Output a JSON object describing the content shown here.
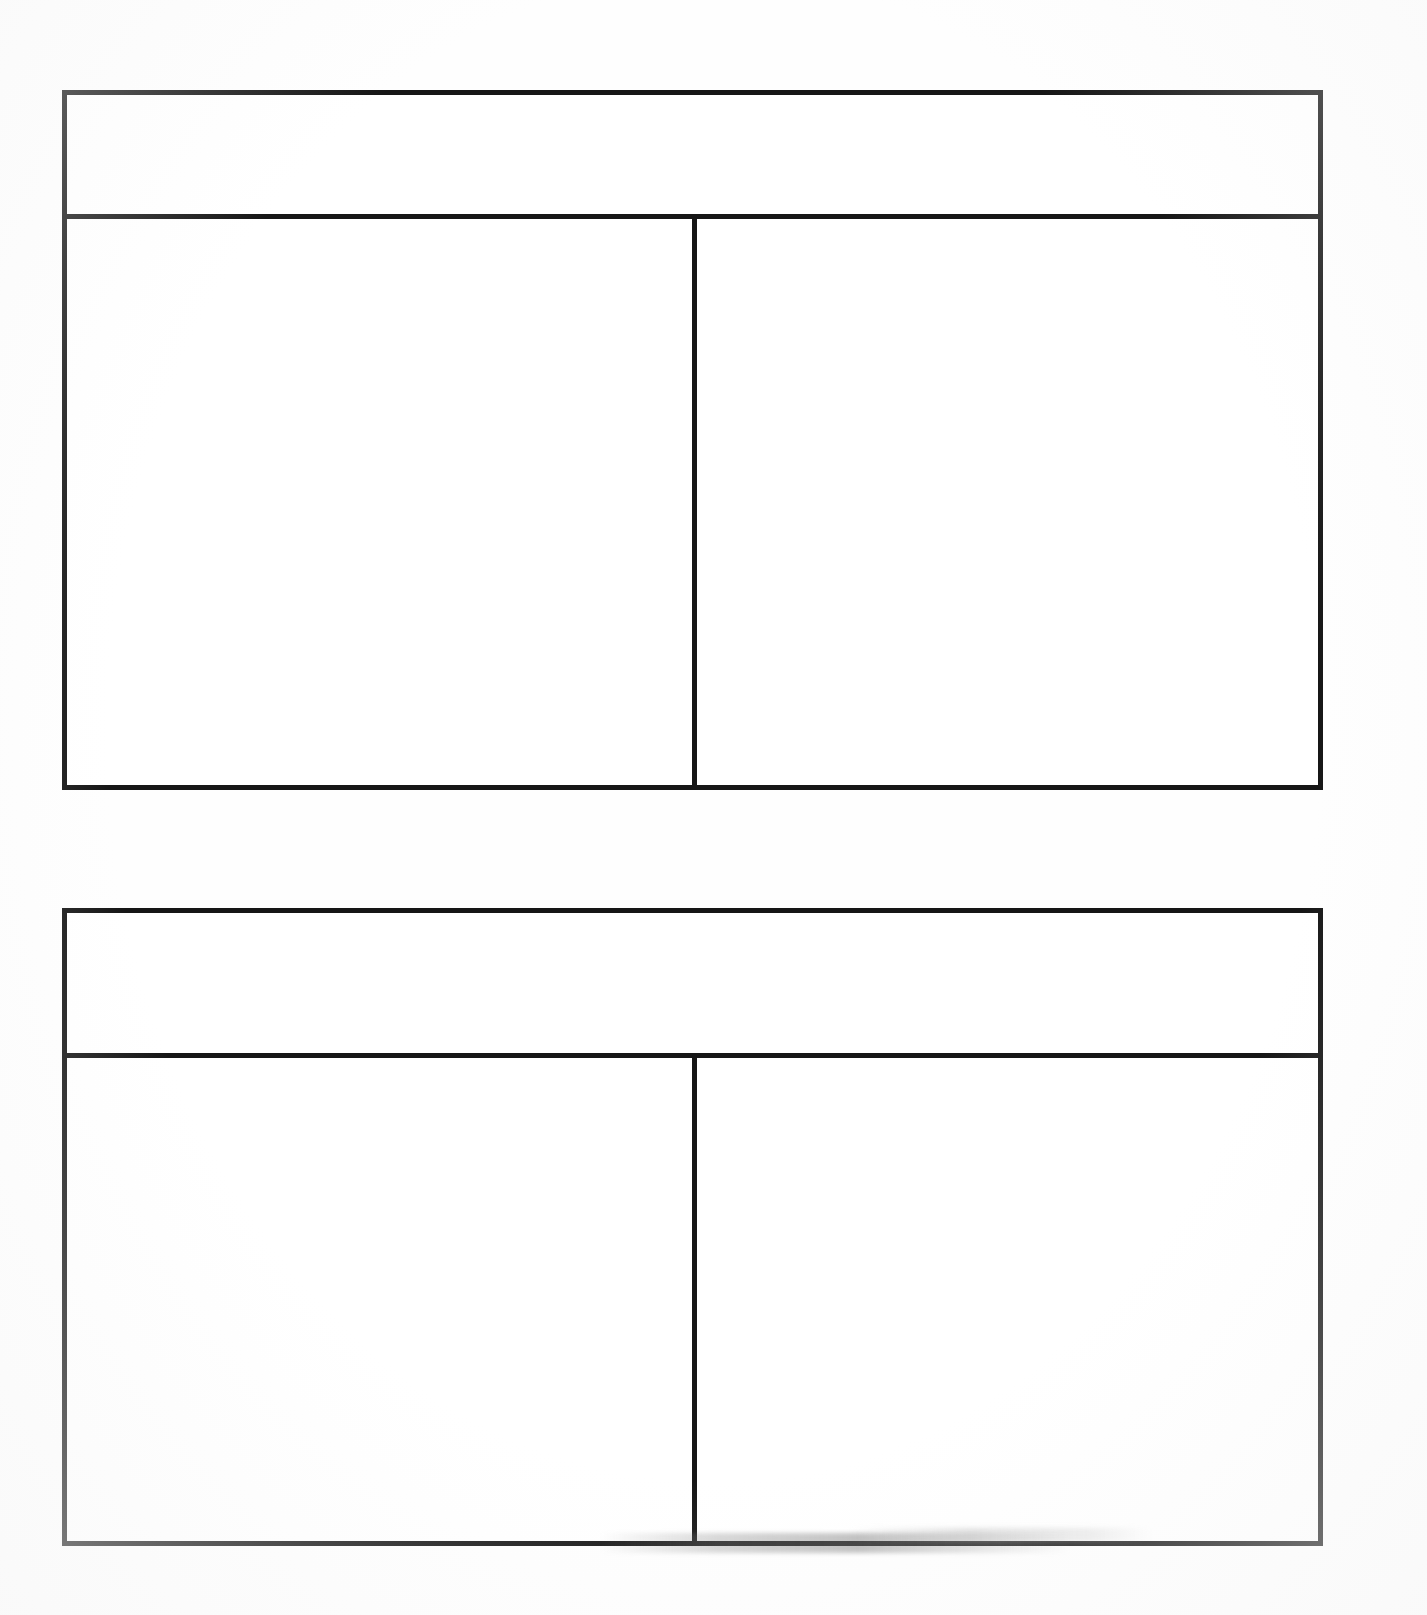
{
  "document": {
    "background_color": "#ffffff",
    "line_color": "#161616",
    "page_width": 1427,
    "page_height": 1615,
    "description": "Scanned page containing two blank two-column tables"
  },
  "tables": [
    {
      "id": "table-1",
      "header": {
        "cell": ""
      },
      "columns": 2,
      "body_rows": [
        {
          "left": "",
          "right": ""
        }
      ]
    },
    {
      "id": "table-2",
      "header": {
        "cell": ""
      },
      "columns": 2,
      "body_rows": [
        {
          "left": "",
          "right": ""
        }
      ]
    }
  ],
  "artifacts": {
    "bottom_smudge": ""
  }
}
